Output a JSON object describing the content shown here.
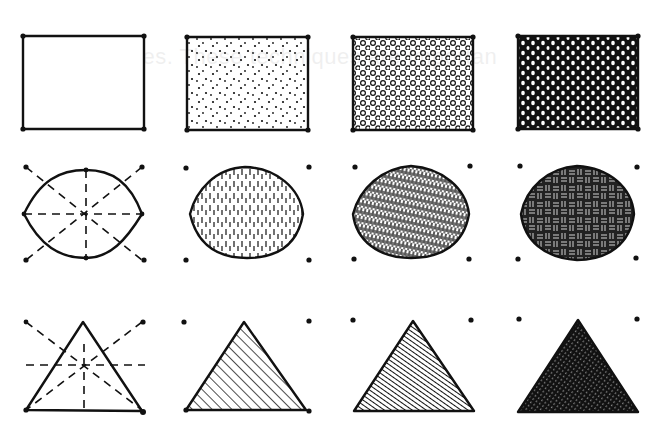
{
  "bleed_through_text": "of these lines. These techniques are importan",
  "ink_color": "#111111",
  "paper_color": "#ffffff",
  "columns": [
    {
      "technique": "outline",
      "tone": "white"
    },
    {
      "technique": "sparse stipple / light hatch",
      "tone": "light"
    },
    {
      "technique": "dense circles / dense hatch",
      "tone": "medium"
    },
    {
      "technique": "reverse circles / crosshatch",
      "tone": "dark"
    }
  ],
  "rows": [
    {
      "shape": "rectangle",
      "construction": "corner dots"
    },
    {
      "shape": "oval",
      "construction": "bounding box dots with dashed center axes"
    },
    {
      "shape": "triangle",
      "construction": "dashed axes through centroid"
    }
  ]
}
